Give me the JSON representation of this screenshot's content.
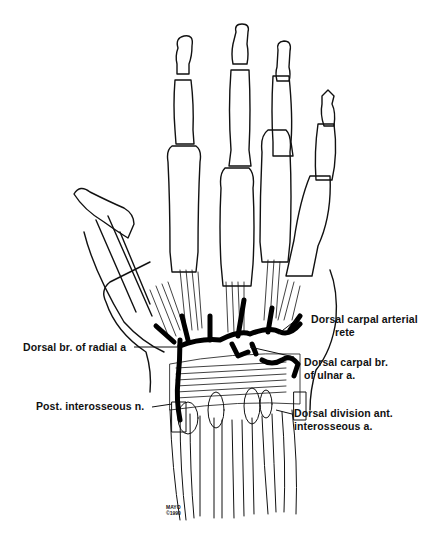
{
  "figure": {
    "colors": {
      "line": "#111111",
      "background": "#ffffff",
      "vessel": "#000000"
    }
  },
  "labels": [
    {
      "id": "dorsal-carpal-arterial-rete",
      "lines": [
        "Dorsal carpal arterial",
        "rete"
      ]
    },
    {
      "id": "dorsal-br-radial",
      "lines": [
        "Dorsal br. of radial  a"
      ]
    },
    {
      "id": "dorsal-carpal-br-ulnar",
      "lines": [
        "Dorsal carpal br.",
        "of ulnar a."
      ]
    },
    {
      "id": "post-interosseous-n",
      "lines": [
        "Post. interosseous n."
      ]
    },
    {
      "id": "dorsal-division-ant-interosseous",
      "lines": [
        "Dorsal division ant.",
        "interosseous a."
      ]
    }
  ],
  "credit": {
    "name": "MAYO",
    "year": "©1990"
  }
}
